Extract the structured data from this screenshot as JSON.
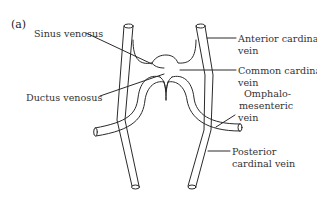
{
  "figure": {
    "panel_label": "(a)",
    "labels": {
      "sinus_venosus": "Sinus venosus",
      "ductus_venosus": "Ductus venosus",
      "anterior_cardinal_1": "Anterior cardinal",
      "anterior_cardinal_2": "vein",
      "common_cardinal_1": "Common cardinal",
      "common_cardinal_2": "vein",
      "omphalo_1": "Omphalo-",
      "omphalo_2": "mesenteric",
      "omphalo_3": "vein",
      "posterior_cardinal_1": "Posterior",
      "posterior_cardinal_2": "cardinal vein"
    },
    "colors": {
      "line": "#2a2a2a",
      "background": "#ffffff"
    }
  }
}
